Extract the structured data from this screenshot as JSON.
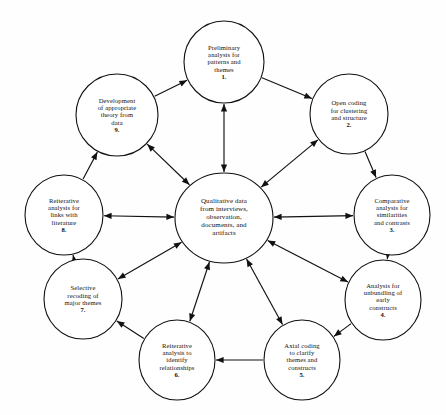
{
  "diagram": {
    "type": "cycle-hub-diagram",
    "stroke_color": "#111111",
    "node_fill": "#ffffff",
    "background": "#fefefe",
    "center": {
      "id": "center",
      "lines": [
        "Qualitative data",
        "from interviews,",
        "observation,",
        "documents, and",
        "artifacts"
      ],
      "number": "",
      "cx": 224,
      "cy": 218,
      "rx": 49,
      "ry": 45
    },
    "nodes": [
      {
        "id": "node-1",
        "number": "1.",
        "lines": [
          "Preliminary",
          "analysis for",
          "patterns and",
          "themes"
        ],
        "cx": 224,
        "cy": 62,
        "rx": 40,
        "ry": 41
      },
      {
        "id": "node-2",
        "number": "2.",
        "lines": [
          "Open coding",
          "for clustering",
          "and structure"
        ],
        "cx": 349,
        "cy": 114,
        "rx": 39,
        "ry": 40
      },
      {
        "id": "node-3",
        "number": "3.",
        "lines": [
          "Comparative",
          "analysis for",
          "similarities",
          "and contrasts"
        ],
        "cx": 392,
        "cy": 215,
        "rx": 38,
        "ry": 40
      },
      {
        "id": "node-4",
        "number": "4.",
        "lines": [
          "Analysis for",
          "unbundling of",
          "early",
          "constructs"
        ],
        "cx": 383,
        "cy": 300,
        "rx": 38,
        "ry": 40
      },
      {
        "id": "node-5",
        "number": "5.",
        "lines": [
          "Axial coding",
          "to clarify",
          "themes and",
          "constructs"
        ],
        "cx": 302,
        "cy": 360,
        "rx": 38,
        "ry": 40
      },
      {
        "id": "node-6",
        "number": "6.",
        "lines": [
          "Reiterative",
          "analysis to",
          "identify",
          "relationships"
        ],
        "cx": 177,
        "cy": 360,
        "rx": 38,
        "ry": 40
      },
      {
        "id": "node-7",
        "number": "7.",
        "lines": [
          "Selective",
          "recoding  of",
          "major themes"
        ],
        "cx": 83,
        "cy": 299,
        "rx": 39,
        "ry": 40
      },
      {
        "id": "node-8",
        "number": "8.",
        "lines": [
          "Reiterative",
          "analysis for",
          "links with",
          "literature"
        ],
        "cx": 64,
        "cy": 215,
        "rx": 39,
        "ry": 40
      },
      {
        "id": "node-9",
        "number": "9.",
        "lines": [
          "Development",
          "of appropriate",
          "theory from",
          "data"
        ],
        "cx": 117,
        "cy": 115,
        "rx": 41,
        "ry": 41
      }
    ],
    "ring_edges": [
      {
        "from": "node-1",
        "to": "node-2",
        "direction": "one-way"
      },
      {
        "from": "node-2",
        "to": "node-3",
        "direction": "one-way"
      },
      {
        "from": "node-3",
        "to": "node-4",
        "direction": "one-way"
      },
      {
        "from": "node-4",
        "to": "node-5",
        "direction": "one-way"
      },
      {
        "from": "node-5",
        "to": "node-6",
        "direction": "one-way"
      },
      {
        "from": "node-6",
        "to": "node-7",
        "direction": "one-way"
      },
      {
        "from": "node-7",
        "to": "node-8",
        "direction": "one-way"
      },
      {
        "from": "node-8",
        "to": "node-9",
        "direction": "one-way"
      },
      {
        "from": "node-9",
        "to": "node-1",
        "direction": "one-way"
      }
    ],
    "spoke_edges": [
      {
        "from": "center",
        "to": "node-1",
        "direction": "two-way"
      },
      {
        "from": "center",
        "to": "node-2",
        "direction": "two-way"
      },
      {
        "from": "center",
        "to": "node-3",
        "direction": "two-way"
      },
      {
        "from": "center",
        "to": "node-4",
        "direction": "two-way"
      },
      {
        "from": "center",
        "to": "node-5",
        "direction": "two-way"
      },
      {
        "from": "center",
        "to": "node-6",
        "direction": "two-way"
      },
      {
        "from": "center",
        "to": "node-7",
        "direction": "two-way"
      },
      {
        "from": "center",
        "to": "node-8",
        "direction": "two-way"
      },
      {
        "from": "center",
        "to": "node-9",
        "direction": "two-way"
      }
    ]
  }
}
